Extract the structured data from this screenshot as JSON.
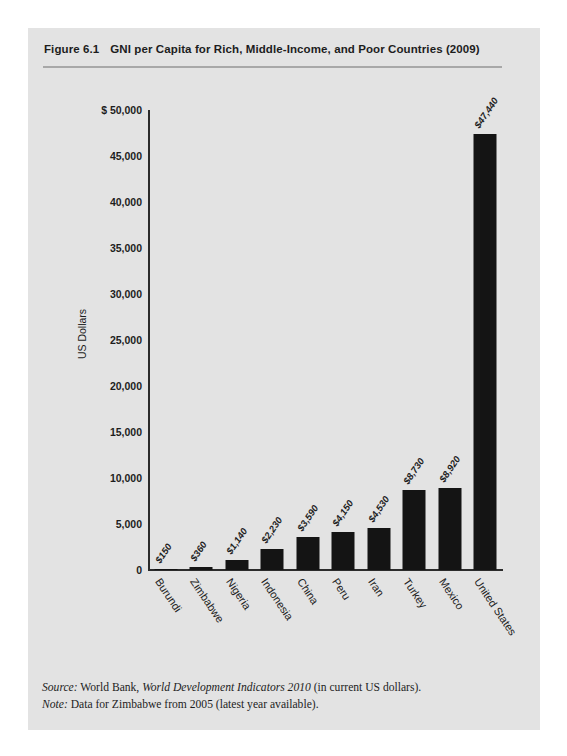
{
  "figure": {
    "number": "Figure 6.1",
    "title": "GNI per Capita for Rich, Middle-Income, and Poor Countries (2009)",
    "source_label": "Source:",
    "source_text_pre": " World Bank, ",
    "source_italic": "World Development Indicators 2010",
    "source_text_post": " (in current US dollars).",
    "note_label": "Note:",
    "note_text": " Data for Zimbabwe from 2005 (latest year available).",
    "panel_color": "#e3e3e3",
    "bar_color": "#141414",
    "axis_color": "#2b2b2b",
    "rule_color": "#a8a8a8"
  },
  "chart_data": {
    "type": "bar",
    "title": "GNI per Capita for Rich, Middle-Income, and Poor Countries (2009)",
    "xlabel": "",
    "ylabel": "US Dollars",
    "categories": [
      "Burundi",
      "Zimbabwe",
      "Nigeria",
      "Indonesia",
      "China",
      "Peru",
      "Iran",
      "Turkey",
      "Mexico",
      "United States"
    ],
    "values": [
      150,
      360,
      1140,
      2230,
      3590,
      4150,
      4530,
      8730,
      8920,
      47440
    ],
    "data_labels": [
      "$150",
      "$360",
      "$1,140",
      "$2,230",
      "$3,590",
      "$4,150",
      "$4,530",
      "$8,730",
      "$8,920",
      "$47,440"
    ],
    "ylim": [
      0,
      50000
    ],
    "ytick_values": [
      0,
      5000,
      10000,
      15000,
      20000,
      25000,
      30000,
      35000,
      40000,
      45000,
      50000
    ],
    "ytick_labels": [
      "0",
      "5,000",
      "10,000",
      "15,000",
      "20,000",
      "25,000",
      "30,000",
      "35,000",
      "40,000",
      "45,000",
      "$ 50,000"
    ],
    "grid": false,
    "legend": null
  }
}
